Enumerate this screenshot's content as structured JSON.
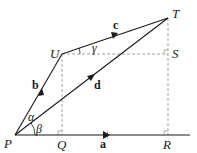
{
  "diagram": {
    "points": {
      "P": {
        "label": "P",
        "x": 15,
        "y": 135
      },
      "Q": {
        "label": "Q",
        "x": 63,
        "y": 135
      },
      "R": {
        "label": "R",
        "x": 168,
        "y": 135
      },
      "S": {
        "label": "S",
        "x": 168,
        "y": 54
      },
      "T": {
        "label": "T",
        "x": 168,
        "y": 18
      },
      "U": {
        "label": "U",
        "x": 62,
        "y": 54
      }
    },
    "vectors": {
      "a": {
        "label": "a",
        "from": "P",
        "to": "R"
      },
      "b": {
        "label": "b",
        "from": "P",
        "to": "U"
      },
      "c": {
        "label": "c",
        "from": "U",
        "to": "T"
      },
      "d": {
        "label": "d",
        "from": "P",
        "to": "T"
      }
    },
    "angles": {
      "alpha": {
        "label": "α"
      },
      "beta": {
        "label": "β"
      },
      "gamma": {
        "label": "γ"
      }
    },
    "colors": {
      "stroke": "#1a1a1a",
      "dashed": "#999999"
    }
  }
}
